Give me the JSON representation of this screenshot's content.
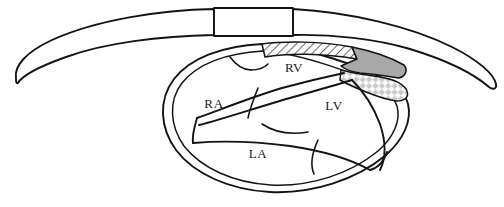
{
  "figure": {
    "background_color": "#ffffff",
    "line_color": "#141414",
    "width": 504,
    "height": 207
  },
  "labels": [
    {
      "id": "rv",
      "text": "RV",
      "x": 294,
      "y": 72,
      "description": "right ventricle"
    },
    {
      "id": "ra",
      "text": "RA",
      "x": 214,
      "y": 108,
      "description": "right atrium"
    },
    {
      "id": "lv",
      "text": "LV",
      "x": 334,
      "y": 110,
      "description": "left ventricle"
    },
    {
      "id": "la",
      "text": "LA",
      "x": 258,
      "y": 158,
      "description": "left atrium"
    }
  ],
  "regions": [
    {
      "id": "hatched-band",
      "name": "hatched-band",
      "pattern": "diagonal-hatch",
      "fill_color": "#ffffff",
      "pattern_color": "#6e6e6e"
    },
    {
      "id": "solid-gray-region",
      "name": "solid-gray-region",
      "pattern": "solid",
      "fill_color": "#a8a8a8",
      "pattern_color": "#a8a8a8"
    },
    {
      "id": "checkered-region",
      "name": "checkered-region",
      "pattern": "diamond-checker",
      "fill_color": "#ffffff",
      "pattern_color": "#c9c9c9"
    }
  ],
  "probe": {
    "name": "transducer-window",
    "shape": "rectangle",
    "x": 214,
    "y": 8,
    "width": 79,
    "height": 28
  }
}
